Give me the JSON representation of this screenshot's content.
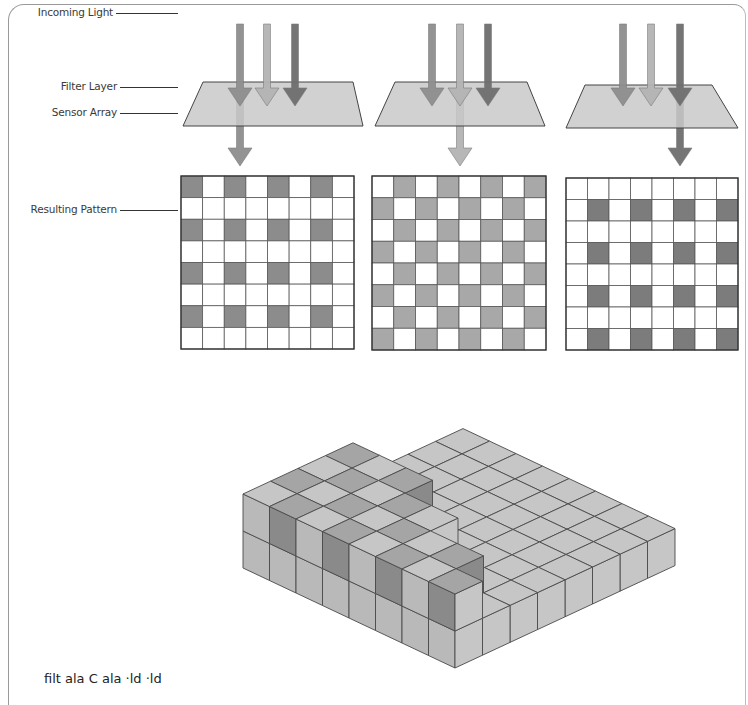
{
  "labels": {
    "incoming_light": "Incoming Light",
    "filter_layer": "Filter Layer",
    "sensor_array": "Sensor Array",
    "resulting_pattern": "Resulting Pattern"
  },
  "caption_partial": "filt                    ala    C             ala  ·ld ·ld",
  "colors": {
    "arrow_a": "#8e8e8e",
    "arrow_b": "#b4b4b4",
    "arrow_c": "#6e6e6e",
    "filter": "#c9c9c9",
    "grid_line": "#5a5a5a",
    "grid_shade_1": "#8c8c8c",
    "grid_shade_2": "#a8a8a8",
    "grid_shade_3": "#7c7c7c",
    "frame": "#9a9a9a"
  },
  "panels": [
    {
      "name": "panel-1",
      "output_arrow_index": 0,
      "pattern": "even-even"
    },
    {
      "name": "panel-2",
      "output_arrow_index": 1,
      "pattern": "checker"
    },
    {
      "name": "panel-3",
      "output_arrow_index": 2,
      "pattern": "odd-odd"
    }
  ],
  "grid_size": 8
}
